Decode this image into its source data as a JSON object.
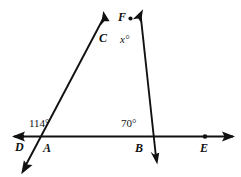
{
  "figure": {
    "kind": "geometry-diagram",
    "width": 241,
    "height": 177,
    "stroke_color": "#111111",
    "background_color": "#ffffff",
    "points": {
      "D": {
        "label": "D",
        "x": 22,
        "y": 136,
        "label_x": 16,
        "label_y": 149,
        "dot": true
      },
      "A": {
        "label": "A",
        "x": 44,
        "y": 136,
        "label_x": 44,
        "label_y": 150,
        "dot": false
      },
      "B": {
        "label": "B",
        "x": 147,
        "y": 136,
        "label_x": 136,
        "label_y": 150,
        "dot": false
      },
      "E": {
        "label": "E",
        "x": 205,
        "y": 136,
        "label_x": 200,
        "label_y": 150,
        "dot": true
      },
      "C": {
        "label": "C",
        "x": 117,
        "y": 40,
        "label_x": 101,
        "label_y": 45,
        "dot": false
      },
      "F": {
        "label": "F",
        "x": 129,
        "y": 19,
        "label_x": 120,
        "label_y": 19,
        "dot": true
      }
    },
    "angles": [
      {
        "name": "angle-at-A",
        "label": "114°",
        "vertex": "A",
        "label_x": 29,
        "label_y": 128
      },
      {
        "name": "angle-at-B",
        "label": "70°",
        "vertex": "B",
        "label_x": 121,
        "label_y": 128
      },
      {
        "name": "angle-at-C",
        "label": "x°",
        "vertex": "C",
        "label_x": 121,
        "label_y": 44
      }
    ],
    "lines": [
      {
        "name": "line-DE",
        "from": {
          "x": 14,
          "y": 136
        },
        "to": {
          "x": 233,
          "y": 136
        },
        "arrow_start": true,
        "arrow_end": true
      },
      {
        "name": "ray-through-A-and-C",
        "from": {
          "x": 22,
          "y": 172
        },
        "to": {
          "x": 104,
          "y": 13
        },
        "arrow_start": true,
        "arrow_end": true
      },
      {
        "name": "ray-through-C-and-B",
        "from": {
          "x": 142,
          "y": 11
        },
        "to": {
          "x": 157,
          "y": 163
        },
        "arrow_start": true,
        "arrow_end": true
      }
    ]
  }
}
